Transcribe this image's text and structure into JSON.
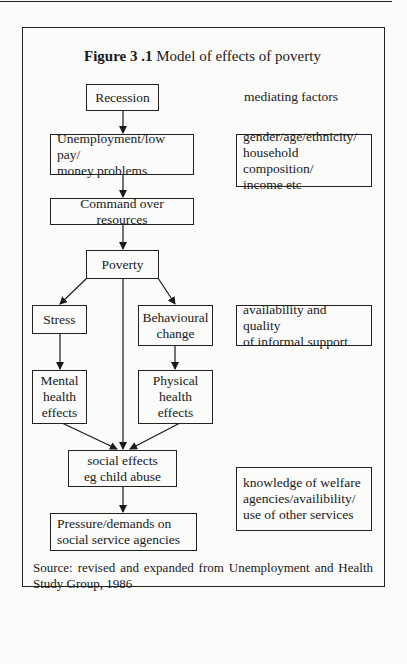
{
  "figure": {
    "label": "Figure 3 .1",
    "caption": "Model of effects of poverty"
  },
  "flow": {
    "recession": "Recession",
    "unemployment_line1": "Unemployment/low pay/",
    "unemployment_line2": "money problems",
    "command": "Command over resources",
    "poverty": "Poverty",
    "stress": "Stress",
    "behavioural_line1": "Behavioural",
    "behavioural_line2": "change",
    "mental_line1": "Mental",
    "mental_line2": "health",
    "mental_line3": "effects",
    "physical_line1": "Physical",
    "physical_line2": "health",
    "physical_line3": "effects",
    "social_line1": "social effects",
    "social_line2": "eg child abuse",
    "pressure_line1": "Pressure/demands on",
    "pressure_line2": "social service agencies"
  },
  "mediating": {
    "heading": "mediating factors",
    "factor1_line1": "gender/age/ethnicity/",
    "factor1_line2": "household composition/",
    "factor1_line3": "income etc",
    "factor2_line1": "availability and quality",
    "factor2_line2": "of informal support",
    "factor3_line1": "knowledge of welfare",
    "factor3_line2": "agencies/availibility/",
    "factor3_line3": "use of other services"
  },
  "source": "Source: revised and expanded from Unemployment and Health Study Group, 1986"
}
